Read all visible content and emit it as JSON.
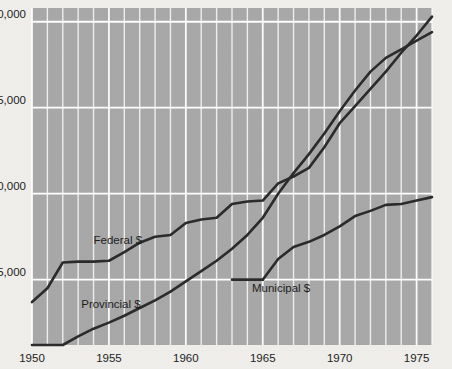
{
  "chart_data": {
    "type": "line",
    "title": "",
    "subtitle": "",
    "xlabel": "",
    "ylabel": "",
    "xlim": [
      1950,
      1976
    ],
    "ylim": [
      1200,
      20800
    ],
    "grid": true,
    "grid_color": "#ffffff",
    "plot_background": "#a8a8a8",
    "page_background": "#efeeea",
    "line_color": "#2b2b2b",
    "legend_position": "inline-labels",
    "y_ticks": [
      5000,
      10000,
      15000,
      20000
    ],
    "y_tick_labels": [
      "$5,000",
      "$10,000",
      "$15,000",
      "$20,000"
    ],
    "x_ticks": [
      1950,
      1955,
      1960,
      1965,
      1970,
      1975
    ],
    "x_tick_labels": [
      "1950",
      "1955",
      "1960",
      "1965",
      "1970",
      "1975"
    ],
    "x_minor_step": 1,
    "series": [
      {
        "name": "Federal $",
        "label": "Federal $",
        "label_x": 1954.0,
        "label_y": 7050,
        "x": [
          1950,
          1951,
          1952,
          1953,
          1954,
          1955,
          1956,
          1957,
          1958,
          1959,
          1960,
          1961,
          1962,
          1963,
          1964,
          1965,
          1966,
          1967,
          1968,
          1969,
          1970,
          1971,
          1972,
          1973,
          1974,
          1975,
          1976
        ],
        "values": [
          3700,
          4500,
          6000,
          6050,
          6050,
          6100,
          6600,
          7150,
          7500,
          7600,
          8300,
          8500,
          8600,
          9400,
          9550,
          9600,
          10600,
          11000,
          11500,
          12700,
          14100,
          15100,
          16100,
          17100,
          18200,
          19200,
          20300
        ]
      },
      {
        "name": "Provincial $",
        "label": "Provincial $",
        "label_x": 1953.2,
        "label_y": 3350,
        "x": [
          1950,
          1951,
          1952,
          1953,
          1954,
          1955,
          1956,
          1957,
          1958,
          1959,
          1960,
          1961,
          1962,
          1963,
          1964,
          1965,
          1966,
          1967,
          1968,
          1969,
          1970,
          1971,
          1972,
          1973,
          1974,
          1975,
          1976
        ],
        "values": [
          1200,
          1200,
          1200,
          1700,
          2150,
          2500,
          2900,
          3350,
          3800,
          4300,
          4900,
          5500,
          6100,
          6800,
          7600,
          8600,
          10000,
          11200,
          12300,
          13500,
          14800,
          16000,
          17100,
          17900,
          18400,
          18900,
          19400
        ]
      },
      {
        "name": "Municipal $",
        "label": "Municipal $",
        "label_x": 1964.3,
        "label_y": 4300,
        "leader_line": {
          "x1": 1963.0,
          "y1": 5000,
          "x2": 1965.0,
          "y2": 5000
        },
        "x": [
          1965,
          1966,
          1967,
          1968,
          1969,
          1970,
          1971,
          1972,
          1973,
          1974,
          1975,
          1976
        ],
        "values": [
          5000,
          6200,
          6900,
          7200,
          7600,
          8100,
          8700,
          9000,
          9350,
          9400,
          9600,
          9800
        ]
      }
    ]
  }
}
